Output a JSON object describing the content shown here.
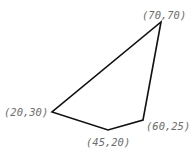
{
  "diagram": {
    "type": "polygon",
    "stroke_color": "#111111",
    "label_color": "#6e6e6e",
    "vertices": [
      {
        "label": "(70,70)",
        "x": 70,
        "y": 70,
        "px": 161,
        "py": 22
      },
      {
        "label": "(60,25)",
        "x": 60,
        "y": 25,
        "px": 143,
        "py": 120
      },
      {
        "label": "(45,20)",
        "x": 45,
        "y": 20,
        "px": 108,
        "py": 130
      },
      {
        "label": "(20,30)",
        "x": 20,
        "y": 30,
        "px": 52,
        "py": 112
      }
    ]
  }
}
